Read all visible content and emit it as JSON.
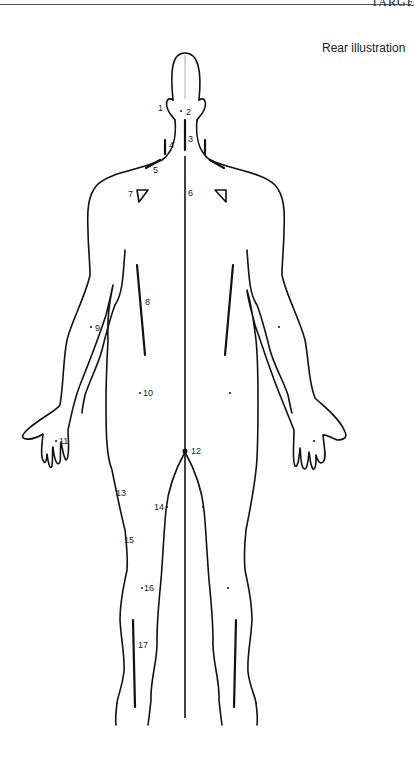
{
  "header": {
    "running_title": "TARGE"
  },
  "figure": {
    "view_label": "Rear illustration",
    "points": [
      {
        "id": "1",
        "label": "1",
        "region": "ear"
      },
      {
        "id": "2",
        "label": "2",
        "region": "occiput"
      },
      {
        "id": "3",
        "label": "3",
        "region": "cervical spine"
      },
      {
        "id": "4",
        "label": "4",
        "region": "neck side"
      },
      {
        "id": "5",
        "label": "5",
        "region": "trapezius"
      },
      {
        "id": "6",
        "label": "6",
        "region": "thoracic spine"
      },
      {
        "id": "7",
        "label": "7",
        "region": "scapula"
      },
      {
        "id": "8",
        "label": "8",
        "region": "paraspinal"
      },
      {
        "id": "9",
        "label": "9",
        "region": "upper arm"
      },
      {
        "id": "10",
        "label": "10",
        "region": "flank"
      },
      {
        "id": "11",
        "label": "11",
        "region": "hand"
      },
      {
        "id": "12",
        "label": "12",
        "region": "coccyx"
      },
      {
        "id": "13",
        "label": "13",
        "region": "hip"
      },
      {
        "id": "14",
        "label": "14",
        "region": "inner thigh"
      },
      {
        "id": "15",
        "label": "15",
        "region": "thigh"
      },
      {
        "id": "16",
        "label": "16",
        "region": "back of knee"
      },
      {
        "id": "17",
        "label": "17",
        "region": "calf"
      }
    ]
  }
}
